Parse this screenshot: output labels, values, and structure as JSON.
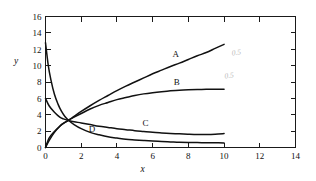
{
  "chart_data": {
    "type": "line",
    "title": "",
    "xlabel": "x",
    "ylabel": "y",
    "xlim": [
      0,
      14
    ],
    "ylim": [
      0,
      16
    ],
    "xticks": [
      0,
      2,
      4,
      6,
      8,
      10,
      12,
      14
    ],
    "yticks": [
      0,
      2,
      4,
      6,
      8,
      10,
      12,
      14,
      16
    ],
    "xtick_labels": [
      "0",
      "2",
      "4",
      "6",
      "8",
      "10",
      "12",
      "14"
    ],
    "ytick_labels": [
      "0",
      "2",
      "4",
      "6",
      "8",
      "10",
      "12",
      "14",
      "16"
    ],
    "grid": false,
    "legend": "inline-curve-labels",
    "frame": "box",
    "tick_direction": "in",
    "crossing_point": {
      "x": 1.3,
      "y": 3.3
    },
    "series": [
      {
        "name": "A",
        "label": "A",
        "label_x": 7.3,
        "label_y": 11.0,
        "x": [
          0,
          0.2,
          0.5,
          0.8,
          1.0,
          1.3,
          1.6,
          2.0,
          2.5,
          3.0,
          3.5,
          4.0,
          4.5,
          5.0,
          5.5,
          6.0,
          6.5,
          7.0,
          7.5,
          8.0,
          8.5,
          9.0,
          9.5,
          10.0
        ],
        "y": [
          0.0,
          1.15,
          1.95,
          2.6,
          2.95,
          3.35,
          3.8,
          4.4,
          5.1,
          5.75,
          6.35,
          6.95,
          7.5,
          8.0,
          8.5,
          9.0,
          9.45,
          9.9,
          10.3,
          10.75,
          11.2,
          11.6,
          12.1,
          12.6
        ]
      },
      {
        "name": "B",
        "label": "B",
        "label_x": 7.35,
        "label_y": 7.6,
        "x": [
          0,
          0.2,
          0.5,
          0.8,
          1.0,
          1.3,
          1.6,
          2.0,
          2.5,
          3.0,
          3.5,
          4.0,
          4.5,
          5.0,
          5.5,
          6.0,
          6.5,
          7.0,
          7.5,
          8.0,
          8.5,
          9.0,
          9.5,
          10.0
        ],
        "y": [
          0.0,
          0.85,
          1.85,
          2.6,
          2.95,
          3.35,
          3.7,
          4.15,
          4.7,
          5.15,
          5.5,
          5.85,
          6.1,
          6.35,
          6.55,
          6.7,
          6.82,
          6.92,
          7.0,
          7.05,
          7.08,
          7.1,
          7.1,
          7.1
        ]
      },
      {
        "name": "C",
        "label": "C",
        "label_x": 5.6,
        "label_y": 2.65,
        "x": [
          0,
          0.2,
          0.5,
          0.8,
          1.0,
          1.3,
          1.6,
          2.0,
          2.5,
          3.0,
          3.5,
          4.0,
          4.5,
          5.0,
          5.5,
          6.0,
          6.5,
          7.0,
          7.5,
          8.0,
          8.5,
          9.0,
          9.5,
          10.0
        ],
        "y": [
          6.0,
          5.1,
          4.3,
          3.7,
          3.5,
          3.3,
          3.15,
          3.0,
          2.8,
          2.6,
          2.45,
          2.3,
          2.18,
          2.05,
          1.95,
          1.85,
          1.78,
          1.72,
          1.67,
          1.63,
          1.6,
          1.6,
          1.63,
          1.7
        ]
      },
      {
        "name": "D",
        "label": "D",
        "label_x": 2.6,
        "label_y": 1.85,
        "x": [
          0,
          0.15,
          0.3,
          0.5,
          0.7,
          0.9,
          1.1,
          1.3,
          1.6,
          2.0,
          2.5,
          3.0,
          3.5,
          4.0,
          4.5,
          5.0,
          5.5,
          6.0,
          6.5,
          7.0,
          7.5,
          8.0,
          8.5,
          9.0,
          9.5,
          10.0
        ],
        "y": [
          12.8,
          10.1,
          8.3,
          6.5,
          5.3,
          4.4,
          3.75,
          3.3,
          2.8,
          2.3,
          1.85,
          1.55,
          1.3,
          1.15,
          1.0,
          0.92,
          0.85,
          0.78,
          0.72,
          0.68,
          0.64,
          0.62,
          0.6,
          0.58,
          0.57,
          0.56
        ]
      }
    ],
    "annotations": [
      {
        "text": "0.5",
        "x": 10.7,
        "y": 11.3,
        "style": "faint-pencil"
      },
      {
        "text": "0.5",
        "x": 10.3,
        "y": 8.5,
        "style": "faint-pencil"
      }
    ]
  }
}
